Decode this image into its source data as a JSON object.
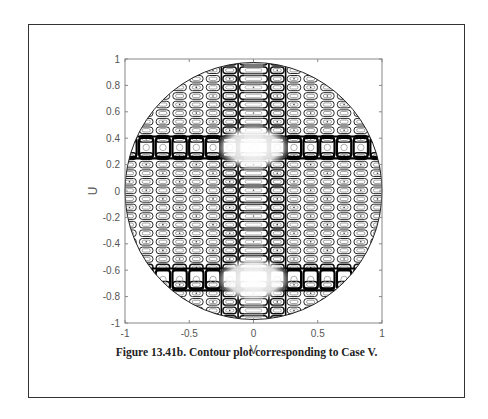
{
  "figure": {
    "caption": "Figure 13.41b. Contour plot corresponding to Case V."
  },
  "chart_data": {
    "type": "contour",
    "title": "",
    "xlabel": "V",
    "ylabel": "U",
    "xlim": [
      -1,
      1
    ],
    "ylim": [
      -1,
      1
    ],
    "x_ticks": [
      -1,
      -0.5,
      0,
      0.5,
      1
    ],
    "x_tick_labels": [
      "-1",
      "-0.5",
      "0",
      "0.5",
      "1"
    ],
    "y_ticks": [
      -1,
      -0.8,
      -0.6,
      -0.4,
      -0.2,
      0,
      0.2,
      0.4,
      0.6,
      0.8,
      1
    ],
    "y_tick_labels": [
      "-1",
      "-0.8",
      "-0.6",
      "-0.4",
      "-0.2",
      "0",
      "0.2",
      "0.4",
      "0.6",
      "0.8",
      "1"
    ],
    "grid": false,
    "legend": null,
    "domain": "unit circle (V^2 + U^2 <= 1)",
    "pattern": {
      "description": "Grid of closed elliptical contour lobes (sidelobes) filling unit circle; bright main-beam bands",
      "main_lobe_rows_U": [
        0.33,
        -0.67
      ],
      "main_lobe_column_V": 0.0,
      "cell_pitch_V": 0.13,
      "cell_pitch_U": 0.065,
      "central_column_width_V": 0.24
    },
    "line_color": "#000000"
  }
}
